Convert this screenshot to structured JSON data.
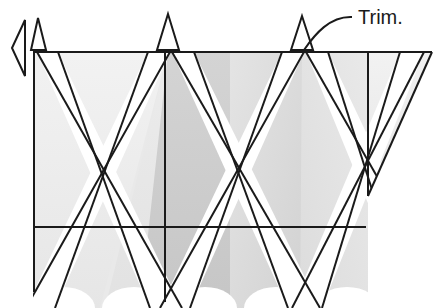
{
  "figure": {
    "type": "technical-line-drawing",
    "background_color": "#ffffff",
    "stroke_color": "#1a1a1a",
    "annotations": [
      {
        "id": "trim-label",
        "text": "Trim.",
        "x": 358,
        "y": 22,
        "leader": {
          "from_x": 352,
          "from_y": 17,
          "ctrl1_x": 330,
          "ctrl1_y": 16,
          "ctrl2_x": 315,
          "ctrl2_y": 34,
          "to_x": 304,
          "to_y": 50
        }
      }
    ],
    "geometry": {
      "top_edge_y": 52,
      "left_edge_x": 33,
      "right_edge_x": 432,
      "mid_line_y": 227,
      "bottom_y": 308,
      "apex_x": 368,
      "apex_y": 196
    },
    "trim_notches": [
      {
        "id": "notch-1",
        "cx": 38,
        "apex_y": 18,
        "half_w": 7,
        "base_y": 52
      },
      {
        "id": "notch-2",
        "cx": 168,
        "apex_y": 14,
        "half_w": 10,
        "base_y": 52
      },
      {
        "id": "notch-3",
        "cx": 302,
        "apex_y": 16,
        "half_w": 10,
        "base_y": 52
      }
    ],
    "arrow_marker": {
      "id": "left-arrow-marker",
      "tip_x": 12,
      "tip_y": 48,
      "top_x": 24,
      "top_y": 20,
      "bottom_x": 24,
      "bottom_y": 76
    },
    "panel_shades": {
      "very_light": "#f0f0f0",
      "light": "#e8e8e8",
      "light_mid": "#e0e0e0",
      "mid": "#d8d8d8",
      "mid_dark": "#cfcfcf",
      "dark": "#c6c6c6",
      "white": "#ffffff"
    },
    "scallops": [
      {
        "id": "scallop-1",
        "cx": 63,
        "rx": 32,
        "ry": 20,
        "cy": 308
      },
      {
        "id": "scallop-2",
        "cx": 134,
        "rx": 32,
        "ry": 20,
        "cy": 308
      },
      {
        "id": "scallop-3",
        "cx": 205,
        "rx": 32,
        "ry": 20,
        "cy": 308
      },
      {
        "id": "scallop-4",
        "cx": 276,
        "rx": 32,
        "ry": 20,
        "cy": 308
      },
      {
        "id": "scallop-5",
        "cx": 347,
        "rx": 32,
        "ry": 20,
        "cy": 308
      }
    ]
  }
}
